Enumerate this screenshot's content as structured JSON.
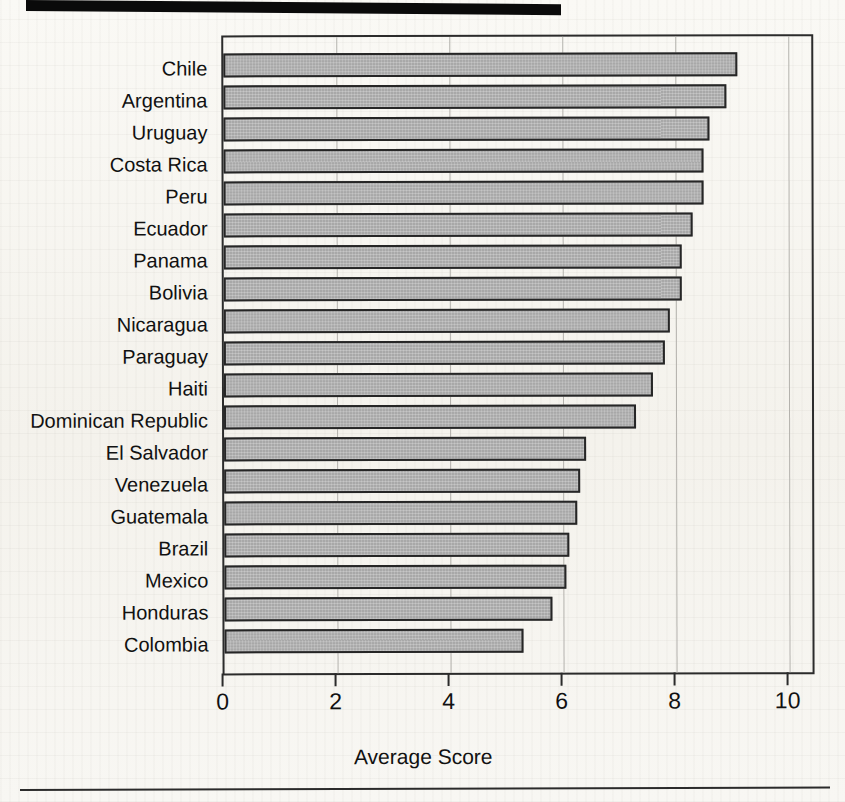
{
  "page": {
    "background_color": "#f7f6f2",
    "artifacts": {
      "top_black_band": "scan-artifact-black-band",
      "bottom_rule": "page-footer-rule"
    }
  },
  "chart_data": {
    "type": "bar",
    "orientation": "horizontal",
    "title": "",
    "subtitle": "",
    "xlabel": "Average Score",
    "ylabel": "",
    "xlim": [
      0,
      10.8
    ],
    "xticks": [
      0,
      2,
      4,
      6,
      8,
      10
    ],
    "xtick_labels": [
      "0",
      "2",
      "4",
      "6",
      "8",
      "10"
    ],
    "grid": "vertical",
    "legend": "none",
    "bar_fill_color": "#a8a8a8",
    "bar_edge_color": "#262626",
    "categories": [
      "Chile",
      "Argentina",
      "Uruguay",
      "Costa Rica",
      "Peru",
      "Ecuador",
      "Panama",
      "Bolivia",
      "Nicaragua",
      "Paraguay",
      "Haiti",
      "Dominican Republic",
      "El Salvador",
      "Venezuela",
      "Guatemala",
      "Brazil",
      "Mexico",
      "Honduras",
      "Colombia"
    ],
    "values": [
      9.1,
      8.9,
      8.6,
      8.5,
      8.5,
      8.3,
      8.1,
      8.1,
      7.9,
      7.8,
      7.6,
      7.3,
      6.4,
      6.3,
      6.25,
      6.1,
      6.05,
      5.8,
      5.3
    ]
  }
}
